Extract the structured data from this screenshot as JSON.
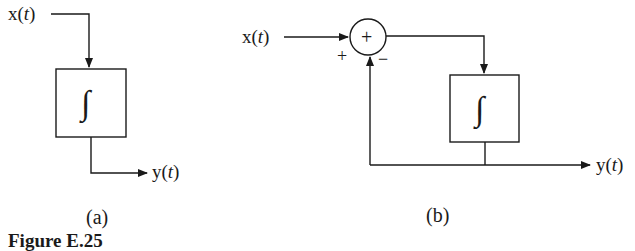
{
  "figure": {
    "caption": "Figure E.25"
  },
  "diagram_a": {
    "label": "(a)",
    "input": {
      "name": "x",
      "arg": "t"
    },
    "block": {
      "symbol": "∫"
    },
    "output": {
      "name": "y",
      "arg": "t"
    }
  },
  "diagram_b": {
    "label": "(b)",
    "input": {
      "name": "x",
      "arg": "t"
    },
    "summer": {
      "symbol": "+",
      "plus_sign": "+",
      "minus_sign": "−"
    },
    "block": {
      "symbol": "∫"
    },
    "output": {
      "name": "y",
      "arg": "t"
    }
  }
}
